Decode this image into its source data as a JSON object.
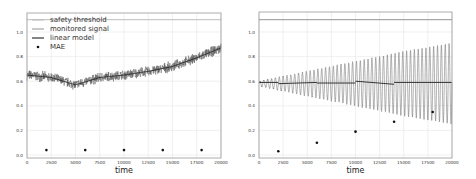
{
  "chart_data": [
    {
      "type": "line",
      "title": "",
      "xlabel": "time",
      "ylabel": "",
      "xlim": [
        0,
        20000
      ],
      "ylim": [
        -0.02,
        1.16
      ],
      "xticks": [
        0,
        2500,
        5000,
        7500,
        10000,
        12500,
        15000,
        17500,
        20000
      ],
      "xtick_labels": [
        "0",
        "2500",
        "5000",
        "7500",
        "10000",
        "12500",
        "15000",
        "17500",
        "20000"
      ],
      "yticks": [
        0.0,
        0.2,
        0.4,
        0.6,
        0.8,
        1.0
      ],
      "ytick_labels": [
        "0.0",
        "0.2",
        "0.4",
        "0.6",
        "0.8",
        "1.0"
      ],
      "grid": true,
      "legend": {
        "position": "upper left",
        "entries": [
          "safety threshold",
          "monitored signal",
          "linear model",
          "MAE"
        ]
      },
      "series": [
        {
          "name": "safety threshold",
          "kind": "hline",
          "value": 1.1,
          "color": "#aaaaaa"
        },
        {
          "name": "monitored signal",
          "kind": "noisy-band",
          "color": "#555555",
          "x": [
            0,
            2500,
            5000,
            7500,
            10000,
            12500,
            15000,
            17500,
            20000
          ],
          "values": [
            0.65,
            0.63,
            0.57,
            0.63,
            0.65,
            0.68,
            0.72,
            0.79,
            0.87
          ],
          "noise_amplitude": 0.04
        },
        {
          "name": "linear model",
          "kind": "line",
          "color": "#222222",
          "x": [
            0,
            2500,
            5000,
            7500,
            10000,
            12500,
            15000,
            17500,
            20000
          ],
          "values": [
            0.65,
            0.63,
            0.57,
            0.63,
            0.65,
            0.68,
            0.72,
            0.79,
            0.87
          ]
        },
        {
          "name": "MAE",
          "kind": "scatter",
          "color": "#111111",
          "x": [
            2000,
            6000,
            10000,
            14000,
            18000
          ],
          "values": [
            0.04,
            0.04,
            0.04,
            0.04,
            0.04
          ]
        }
      ]
    },
    {
      "type": "line",
      "title": "",
      "xlabel": "time",
      "ylabel": "",
      "xlim": [
        0,
        20000
      ],
      "ylim": [
        -0.02,
        1.16
      ],
      "xticks": [
        0,
        2500,
        5000,
        7500,
        10000,
        12500,
        15000,
        17500,
        20000
      ],
      "xtick_labels": [
        "0",
        "2500",
        "5000",
        "7500",
        "10000",
        "12500",
        "15000",
        "17500",
        "20000"
      ],
      "yticks": [
        0.0,
        0.2,
        0.4,
        0.6,
        0.8,
        1.0
      ],
      "ytick_labels": [
        "0.0",
        "0.2",
        "0.4",
        "0.6",
        "0.8",
        "1.0"
      ],
      "grid": true,
      "legend": null,
      "series": [
        {
          "name": "safety threshold",
          "kind": "hline",
          "value": 1.1,
          "color": "#aaaaaa"
        },
        {
          "name": "monitored signal",
          "kind": "oscillation",
          "color": "#666666",
          "center": 0.58,
          "cycles": 50,
          "x": [
            0,
            5000,
            10000,
            15000,
            20000
          ],
          "amplitude": [
            0.02,
            0.1,
            0.18,
            0.26,
            0.33
          ]
        },
        {
          "name": "linear model",
          "kind": "piecewise",
          "color": "#222222",
          "segments": [
            {
              "x": [
                0,
                2000
              ],
              "values": [
                0.59,
                0.59
              ]
            },
            {
              "x": [
                2000,
                6000
              ],
              "values": [
                0.58,
                0.59
              ]
            },
            {
              "x": [
                6000,
                10000
              ],
              "values": [
                0.585,
                0.585
              ]
            },
            {
              "x": [
                10000,
                14000
              ],
              "values": [
                0.6,
                0.575
              ]
            },
            {
              "x": [
                14000,
                20000
              ],
              "values": [
                0.59,
                0.59
              ]
            }
          ]
        },
        {
          "name": "MAE",
          "kind": "scatter",
          "color": "#111111",
          "x": [
            2000,
            6000,
            10000,
            14000,
            18000
          ],
          "values": [
            0.03,
            0.1,
            0.19,
            0.27,
            0.35
          ]
        }
      ]
    }
  ],
  "panels": [
    {
      "xlabel": "time"
    },
    {
      "xlabel": "time"
    }
  ],
  "legend_labels": [
    "safety threshold",
    "monitored signal",
    "linear model",
    "MAE"
  ]
}
